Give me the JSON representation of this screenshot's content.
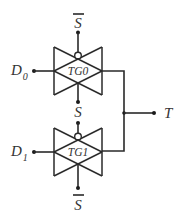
{
  "diagram": {
    "type": "transmission-gate multiplexer",
    "gates": [
      {
        "id": "tg0",
        "label": "TG0",
        "input_label": "D",
        "input_sub": "0",
        "top_control": "S",
        "top_control_inverted": true,
        "bottom_control": "S",
        "bottom_control_inverted": false
      },
      {
        "id": "tg1",
        "label": "TG1",
        "input_label": "D",
        "input_sub": "1",
        "top_control": "S",
        "top_control_inverted": false,
        "bottom_control": "S",
        "bottom_control_inverted": true
      }
    ],
    "labels": {
      "top_select": "S",
      "middle_select": "S",
      "bottom_select": "S",
      "d0_main": "D",
      "d0_sub": "0",
      "d1_main": "D",
      "d1_sub": "1",
      "tg0": "TG0",
      "tg1": "TG1",
      "output": "T"
    },
    "colors": {
      "line": "#2a2a2a",
      "text": "#333333",
      "background": "#ffffff"
    }
  }
}
